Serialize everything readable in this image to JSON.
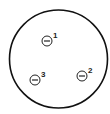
{
  "diagram": {
    "outer_circle": {
      "cx": 58.5,
      "cy": 59,
      "r": 49,
      "stroke": "#111111",
      "stroke_width": 1.6
    },
    "charges": [
      {
        "id": "1",
        "label": "1",
        "sign": "negative",
        "cx": 47,
        "cy": 41,
        "r": 5,
        "label_x": 53,
        "label_y": 38
      },
      {
        "id": "2",
        "label": "2",
        "sign": "negative",
        "cx": 82,
        "cy": 76,
        "r": 5,
        "label_x": 88,
        "label_y": 73
      },
      {
        "id": "3",
        "label": "3",
        "sign": "negative",
        "cx": 35,
        "cy": 80,
        "r": 5,
        "label_x": 41,
        "label_y": 77
      }
    ]
  }
}
